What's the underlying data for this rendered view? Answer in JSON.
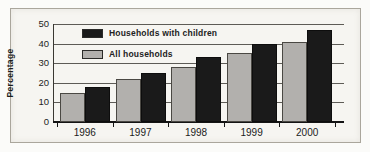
{
  "chart_data": {
    "type": "bar",
    "title": "",
    "xlabel": "",
    "ylabel": "Percentage",
    "categories": [
      "1996",
      "1997",
      "1998",
      "1999",
      "2000"
    ],
    "series": [
      {
        "name": "All households",
        "color": "#b2b0ad",
        "values": [
          15,
          22,
          28,
          35,
          41
        ]
      },
      {
        "name": "Households with children",
        "color": "#1a1a1a",
        "values": [
          18,
          25,
          33,
          40,
          47
        ]
      }
    ],
    "legend": [
      {
        "label": "Households with children",
        "color": "#1a1a1a"
      },
      {
        "label": "All households",
        "color": "#b2b0ad"
      }
    ],
    "ylim": [
      0,
      50
    ],
    "yticks": [
      0,
      10,
      20,
      30,
      40,
      50
    ],
    "grid": true,
    "legend_position": "top-left"
  }
}
